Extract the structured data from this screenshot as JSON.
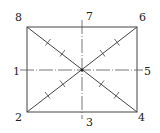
{
  "diagram": {
    "type": "rectangle-with-symmetry-axes",
    "rectangle": {
      "x1": 27,
      "y1": 27,
      "x2": 137,
      "y2": 112
    },
    "center": {
      "x": 82,
      "y": 70
    },
    "colors": {
      "line": "#444444",
      "axis": "#555555",
      "background": "#ffffff"
    },
    "labels": [
      {
        "id": "1",
        "text": "1",
        "x": 13,
        "y": 75
      },
      {
        "id": "2",
        "text": "2",
        "x": 15,
        "y": 121
      },
      {
        "id": "3",
        "text": "3",
        "x": 86,
        "y": 126
      },
      {
        "id": "4",
        "text": "4",
        "x": 138,
        "y": 121
      },
      {
        "id": "5",
        "text": "5",
        "x": 144,
        "y": 75
      },
      {
        "id": "6",
        "text": "6",
        "x": 139,
        "y": 21
      },
      {
        "id": "7",
        "text": "7",
        "x": 86,
        "y": 20
      },
      {
        "id": "8",
        "text": "8",
        "x": 15,
        "y": 21
      }
    ],
    "axes": [
      {
        "name": "vertical-axis-7-3",
        "from": "7",
        "to": "3",
        "style": "dash-dot"
      },
      {
        "name": "horizontal-axis-1-5",
        "from": "1",
        "to": "5",
        "style": "dash-dot"
      }
    ],
    "diagonals": [
      {
        "name": "diagonal-8-4",
        "from": "8",
        "to": "4",
        "tick_marks": 4
      },
      {
        "name": "diagonal-6-2",
        "from": "6",
        "to": "2",
        "tick_marks": 4
      }
    ]
  }
}
